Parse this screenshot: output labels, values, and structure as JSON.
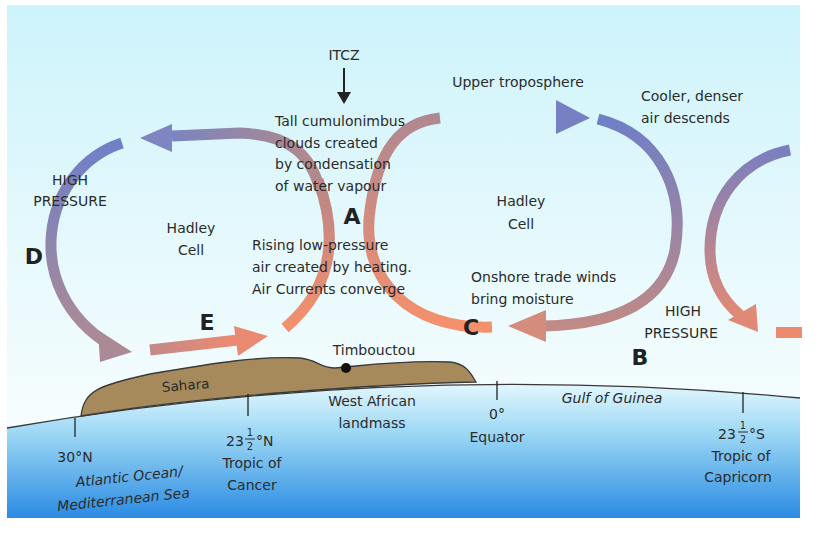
{
  "diagram": {
    "title_labels": {
      "itcz": "ITCZ",
      "upper_troposphere": "Upper troposphere",
      "cloud_note": [
        "Tall cumulonimbus",
        "clouds created",
        "by condensation",
        "of water vapour"
      ],
      "rising_note": [
        "Rising low-pressure",
        "air created by heating.",
        "Air Currents converge"
      ],
      "descend_note": [
        "Cooler, denser",
        "air descends"
      ],
      "trade_winds_note": [
        "Onshore trade winds",
        "bring moisture"
      ],
      "high_pressure_left": [
        "HIGH",
        "PRESSURE"
      ],
      "high_pressure_right": [
        "HIGH",
        "PRESSURE"
      ],
      "hadley_left": [
        "Hadley",
        "Cell"
      ],
      "hadley_right": [
        "Hadley",
        "Cell"
      ]
    },
    "point_letters": {
      "a": "A",
      "b": "B",
      "c": "C",
      "d": "D",
      "e": "E"
    },
    "land": {
      "sahara": "Sahara",
      "timbouctou": "Timbouctou",
      "west_african": [
        "West African",
        "landmass"
      ]
    },
    "sea": {
      "gulf": "Gulf of Guinea",
      "atlantic": [
        "Atlantic Ocean/",
        "Mediterranean Sea"
      ]
    },
    "latitudes": [
      {
        "value": "30°N",
        "name": []
      },
      {
        "value_whole": "23",
        "value_num": "1",
        "value_den": "2",
        "value_suffix": "°N",
        "name": [
          "Tropic of",
          "Cancer"
        ]
      },
      {
        "value": "0°",
        "name": [
          "Equator"
        ]
      },
      {
        "value_whole": "23",
        "value_num": "1",
        "value_den": "2",
        "value_suffix": "°S",
        "name": [
          "Tropic of",
          "Capricorn"
        ]
      }
    ],
    "colors": {
      "sky_top": "#cdf3fb",
      "sky_bottom": "#f7fcfe",
      "sea_top": "#d4f1fb",
      "sea_bottom": "#1f86e0",
      "land": "#a68a5c",
      "arrow_cool": "#6f7fc4",
      "arrow_warm": "#f0896a"
    }
  }
}
